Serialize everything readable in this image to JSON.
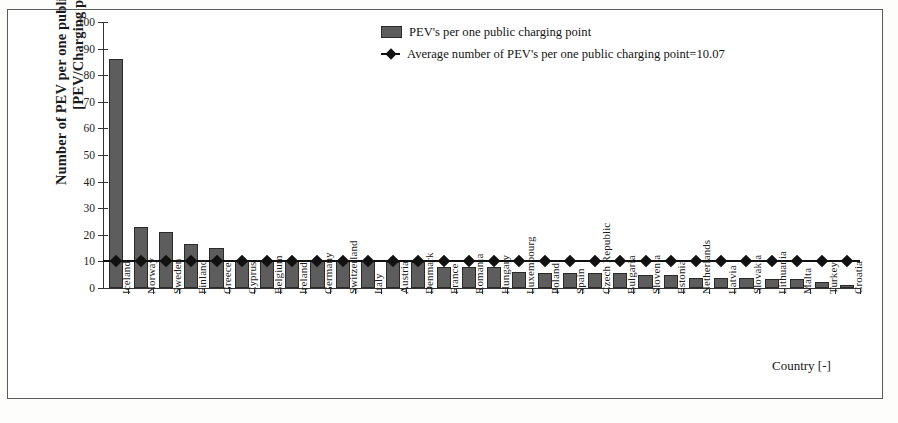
{
  "chart_data": {
    "type": "bar",
    "title": "",
    "xlabel": "Country [-]",
    "ylabel": "Number of PEV per one public charging point [PEV/Charging point]",
    "ylabel_line1": "Number of PEV per one public charging point",
    "ylabel_line2": "[PEV/Charging point]",
    "ylim": [
      0,
      100
    ],
    "ytick_values": [
      0,
      10,
      20,
      30,
      40,
      50,
      60,
      70,
      80,
      90,
      100
    ],
    "ytick_labels": [
      "0",
      "10",
      "20",
      "30",
      "40",
      "50",
      "60",
      "70",
      "80",
      "90",
      "100"
    ],
    "grid": false,
    "legend_position": "top-right",
    "categories": [
      "Iceland",
      "Norway",
      "Sweden",
      "Finland",
      "Greece",
      "Cyprus",
      "Belgium",
      "Ireland",
      "Germany",
      "Switzerland",
      "Italy",
      "Austria",
      "Denmark",
      "France",
      "Romania",
      "Hungary",
      "Luxembourg",
      "Poland",
      "Spain",
      "Czech Republic",
      "Bulgaria",
      "Slovenia",
      "Estonia",
      "Netherlands",
      "Latvia",
      "Slovakia",
      "Lithuania",
      "Malta",
      "Turkey",
      "Croatia"
    ],
    "values": [
      86.0,
      23.0,
      21.0,
      16.5,
      15.2,
      10.6,
      10.3,
      10.2,
      10.1,
      10.1,
      10.0,
      9.9,
      9.7,
      8.0,
      7.9,
      7.8,
      6.0,
      5.8,
      5.7,
      5.6,
      5.5,
      4.9,
      4.8,
      3.9,
      3.7,
      3.6,
      3.5,
      3.4,
      2.2,
      1.1
    ],
    "series": [
      {
        "name": "PEV's per one public charging point",
        "type": "bar",
        "color": "#5d5d5d",
        "values": [
          86.0,
          23.0,
          21.0,
          16.5,
          15.2,
          10.6,
          10.3,
          10.2,
          10.1,
          10.1,
          10.0,
          9.9,
          9.7,
          8.0,
          7.9,
          7.8,
          6.0,
          5.8,
          5.7,
          5.6,
          5.5,
          4.9,
          4.8,
          3.9,
          3.7,
          3.6,
          3.5,
          3.4,
          2.2,
          1.1
        ]
      },
      {
        "name": "Average number of PEV's per one public charging point=10.07",
        "type": "line",
        "color": "#111111",
        "marker": "diamond",
        "constant_value": 10.07
      }
    ],
    "legend": [
      "PEV's per one public charging point",
      "Average number of PEV's per one public charging point=10.07"
    ],
    "average_value": 10.07
  },
  "legend": {
    "bar_label": "PEV's per one public charging point",
    "line_label": "Average number of PEV's per one public charging point=10.07"
  },
  "axes": {
    "x_title": "Country [-]",
    "y_title_line1": "Number of PEV per one public charging point",
    "y_title_line2": "[PEV/Charging point]"
  }
}
